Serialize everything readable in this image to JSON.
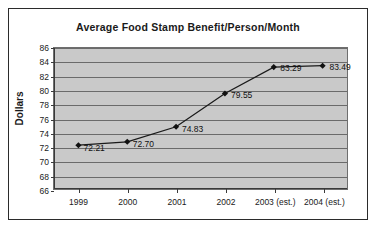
{
  "chart_data": {
    "type": "line",
    "title": "Average Food Stamp Benefit/Person/Month",
    "xlabel": "",
    "ylabel": "Dollars",
    "categories": [
      "1999",
      "2000",
      "2001",
      "2002",
      "2003 (est.)",
      "2004 (est.)"
    ],
    "values": [
      72.21,
      72.7,
      74.83,
      79.55,
      83.29,
      83.49
    ],
    "point_labels": [
      "72.21",
      "72.70",
      "74.83",
      "79.55",
      "83.29",
      "83.49"
    ],
    "ylim": [
      66,
      86
    ],
    "yticks": [
      66,
      68,
      70,
      72,
      74,
      76,
      78,
      80,
      82,
      84,
      86
    ],
    "ytick_labels": [
      "66",
      "68",
      "70",
      "72",
      "74",
      "76",
      "78",
      "80",
      "82",
      "84",
      "86"
    ],
    "grid": true,
    "legend": false,
    "series_name": "Average Food Stamp Benefit/Person/Month",
    "marker": "diamond",
    "colors": {
      "line": "#1a1a1a",
      "marker": "#111111",
      "plot_background": "#c9c9c9",
      "gridline": "#6a6a6a",
      "axis": "#3a3a3a",
      "text": "#1a1a1a",
      "page_background": "#ffffff",
      "border": "#2b2b2b"
    }
  }
}
